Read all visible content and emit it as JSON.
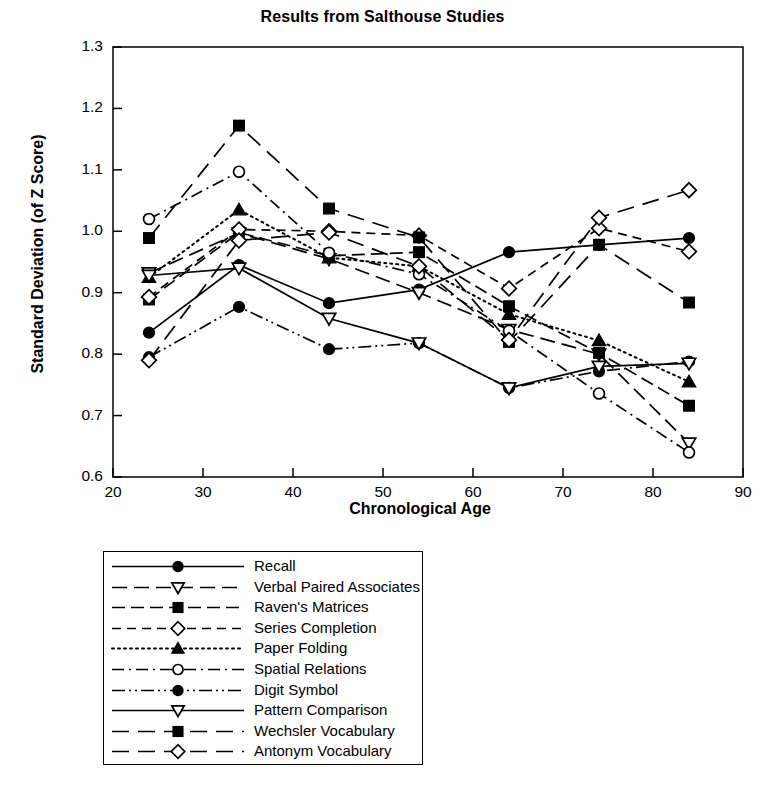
{
  "chart_data": {
    "type": "line",
    "title": "Results from Salthouse Studies",
    "xlabel": "Chronological Age",
    "ylabel": "Standard Deviation (of Z Score)",
    "xlim": [
      20,
      90
    ],
    "ylim": [
      0.6,
      1.3
    ],
    "xticks": [
      "20",
      "30",
      "40",
      "50",
      "60",
      "70",
      "80",
      "90"
    ],
    "yticks": [
      "1.3",
      "1.2",
      "1.1",
      "1.0",
      "0.9",
      "0.8",
      "0.7",
      "0.6"
    ],
    "grid": false,
    "legend_position": "below-plot",
    "x": [
      24,
      34,
      44,
      54,
      64,
      74,
      84
    ],
    "series": [
      {
        "name": "Recall",
        "marker": "filled-circle",
        "dash": "solid",
        "values": [
          0.835,
          0.945,
          0.883,
          0.905,
          0.966,
          0.978,
          0.989
        ]
      },
      {
        "name": "Verbal Paired Associates",
        "marker": "open-down-triangle",
        "dash": "long-dash",
        "values": [
          0.932,
          0.997,
          0.955,
          0.9,
          0.84,
          0.8,
          0.655
        ]
      },
      {
        "name": "Raven's Matrices",
        "marker": "filled-square",
        "dash": "dash-long",
        "values": [
          0.889,
          0.998,
          0.96,
          0.966,
          0.878,
          0.802,
          0.716
        ]
      },
      {
        "name": "Series Completion",
        "marker": "open-diamond",
        "dash": "dashed",
        "values": [
          0.893,
          1.003,
          1.0,
          0.993,
          0.907,
          1.005,
          0.967
        ]
      },
      {
        "name": "Paper Folding",
        "marker": "filled-up-triangle",
        "dash": "dotted",
        "values": [
          0.925,
          1.035,
          0.957,
          0.943,
          0.865,
          0.822,
          0.755
        ]
      },
      {
        "name": "Spatial Relations",
        "marker": "open-circle",
        "dash": "dash-dot",
        "values": [
          1.02,
          1.097,
          0.965,
          0.93,
          0.838,
          0.736,
          0.64
        ]
      },
      {
        "name": "Digit Symbol",
        "marker": "filled-circle",
        "dash": "dash-dot-dot",
        "values": [
          0.795,
          0.877,
          0.808,
          0.818,
          0.745,
          0.772,
          0.788
        ]
      },
      {
        "name": "Pattern Comparison",
        "marker": "open-down-triangle",
        "dash": "solid",
        "values": [
          0.928,
          0.94,
          0.858,
          0.818,
          0.745,
          0.78,
          0.785
        ]
      },
      {
        "name": "Wechsler Vocabulary",
        "marker": "filled-square",
        "dash": "long-dash-gap",
        "values": [
          0.989,
          1.172,
          1.037,
          0.99,
          0.82,
          0.978,
          0.884
        ]
      },
      {
        "name": "Antonym Vocabulary",
        "marker": "open-diamond",
        "dash": "long-dash-gap",
        "values": [
          0.79,
          0.985,
          0.998,
          0.943,
          0.823,
          1.022,
          1.067
        ]
      }
    ]
  }
}
